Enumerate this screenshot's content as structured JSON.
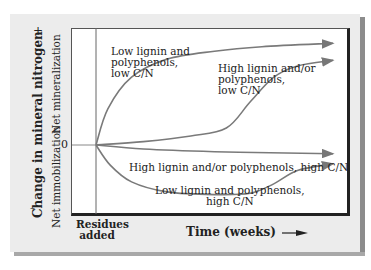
{
  "chart_data": {
    "type": "line",
    "title": "",
    "ylabel": "Change in mineral nitrogen",
    "y_sublabels": {
      "positive": "Net mineralization",
      "negative": "Net immobilization"
    },
    "y_signs": {
      "top": "+",
      "bottom": "–"
    },
    "y_zero_label": "0",
    "xlabel": "Time (weeks)",
    "x_marker_label": "Residues added",
    "xlim": [
      0,
      10
    ],
    "ylim": [
      -1,
      1
    ],
    "series": [
      {
        "name": "Low lignin and polyphenols, low C/N",
        "label_lines": [
          "Low lignin and",
          "polyphenols,",
          "low C/N"
        ],
        "points": [
          [
            0,
            0
          ],
          [
            0.5,
            0.32
          ],
          [
            1.5,
            0.6
          ],
          [
            3,
            0.76
          ],
          [
            5,
            0.83
          ],
          [
            7,
            0.87
          ],
          [
            10,
            0.9
          ]
        ]
      },
      {
        "name": "High lignin and/or polyphenols, low C/N",
        "label_lines": [
          "High lignin and/or",
          "polyphenols,",
          "low C/N"
        ],
        "points": [
          [
            0,
            0
          ],
          [
            2,
            0.03
          ],
          [
            4,
            0.08
          ],
          [
            5.5,
            0.15
          ],
          [
            6.5,
            0.38
          ],
          [
            7.5,
            0.6
          ],
          [
            8.5,
            0.7
          ],
          [
            10,
            0.75
          ]
        ]
      },
      {
        "name": "High lignin and/or polyphenols, high C/N",
        "label_lines": [
          "High lignin and/or polyphenols, high C/N"
        ],
        "points": [
          [
            0,
            0
          ],
          [
            2,
            -0.06
          ],
          [
            5,
            -0.1
          ],
          [
            8,
            -0.12
          ],
          [
            10,
            -0.13
          ]
        ]
      },
      {
        "name": "Low lignin and polyphenols, high C/N",
        "label_lines": [
          "Low lignin and polyphenols,",
          "high C/N"
        ],
        "points": [
          [
            0,
            0
          ],
          [
            0.6,
            -0.3
          ],
          [
            1.5,
            -0.55
          ],
          [
            3,
            -0.7
          ],
          [
            5,
            -0.74
          ],
          [
            6.5,
            -0.72
          ],
          [
            7.5,
            -0.58
          ],
          [
            8.5,
            -0.38
          ],
          [
            10,
            -0.28
          ]
        ]
      }
    ]
  }
}
